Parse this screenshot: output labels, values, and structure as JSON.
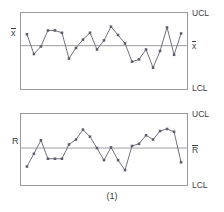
{
  "figure": {
    "caption": "(1)",
    "type": "xbar-r-control-chart-pair"
  },
  "charts": {
    "xbar": {
      "left_label": "x",
      "left_label_overbar": true,
      "ucl_label": "UCL",
      "center_label": "x",
      "center_label_overbar": true,
      "lcl_label": "LCL"
    },
    "r": {
      "left_label": "R",
      "left_label_overbar": false,
      "ucl_label": "UCL",
      "center_label": "R",
      "center_label_overbar": true,
      "lcl_label": "LCL"
    }
  },
  "style": {
    "line_color": "#6e6e7d",
    "frame_color": "#9a9a9a",
    "center_line_color": "#9a9a9a",
    "marker_color": "#5d5d6b",
    "text_color": "#3d3d3d",
    "background": "#ffffff"
  },
  "chart_data": [
    {
      "type": "line",
      "name": "xbar-chart",
      "title": "",
      "xlabel": "",
      "ylabel": "x",
      "ylim": [
        0,
        100
      ],
      "xlim": [
        0,
        24
      ],
      "grid": false,
      "legend": null,
      "center_line": 57,
      "ucl": 100,
      "lcl": 0,
      "x": [
        1,
        2,
        3,
        4,
        5,
        6,
        7,
        8,
        9,
        10,
        11,
        12,
        13,
        14,
        15,
        16,
        17,
        18,
        19,
        20,
        21,
        22,
        23
      ],
      "values": [
        72,
        46,
        56,
        77,
        77,
        74,
        40,
        54,
        65,
        74,
        52,
        64,
        82,
        71,
        60,
        36,
        39,
        52,
        28,
        50,
        81,
        45,
        73
      ],
      "series": [
        {
          "name": "subgroup-mean",
          "values": [
            72,
            46,
            56,
            77,
            77,
            74,
            40,
            54,
            65,
            74,
            52,
            64,
            82,
            71,
            60,
            36,
            39,
            52,
            28,
            50,
            81,
            45,
            73
          ]
        }
      ]
    },
    {
      "type": "line",
      "name": "r-chart",
      "title": "",
      "xlabel": "",
      "ylabel": "R",
      "ylim": [
        0,
        100
      ],
      "xlim": [
        0,
        24
      ],
      "grid": false,
      "legend": null,
      "center_line": 52,
      "ucl": 100,
      "lcl": 0,
      "x": [
        1,
        2,
        3,
        4,
        5,
        6,
        7,
        8,
        9,
        10,
        11,
        12,
        13,
        14,
        15,
        16,
        17,
        18,
        19,
        20,
        21,
        22,
        23
      ],
      "values": [
        26,
        44,
        63,
        37,
        37,
        37,
        57,
        64,
        78,
        68,
        52,
        35,
        53,
        35,
        21,
        55,
        58,
        70,
        64,
        76,
        79,
        75,
        32
      ],
      "series": [
        {
          "name": "subgroup-range",
          "values": [
            26,
            44,
            63,
            37,
            37,
            37,
            57,
            64,
            78,
            68,
            52,
            35,
            53,
            35,
            21,
            55,
            58,
            70,
            64,
            76,
            79,
            75,
            32
          ]
        }
      ]
    }
  ]
}
